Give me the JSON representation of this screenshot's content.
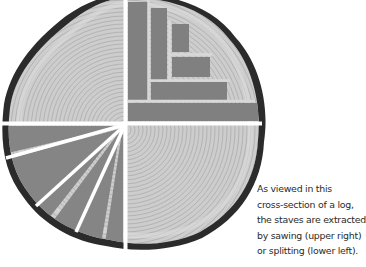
{
  "figure": {
    "quadrants": {
      "upper_right": "sawing pattern (rectangular staves)",
      "lower_left": "splitting pattern (radial wedges)"
    },
    "colors": {
      "bark": "#2a2a2a",
      "wood": "#c9c9c9",
      "stave": "#7f7f7f",
      "cut_line": "#ffffff"
    }
  },
  "caption": {
    "lines": [
      "As viewed in this",
      "cross-section of a log,",
      "the staves are extracted",
      "by sawing (upper right)",
      "or splitting (lower left)."
    ]
  }
}
